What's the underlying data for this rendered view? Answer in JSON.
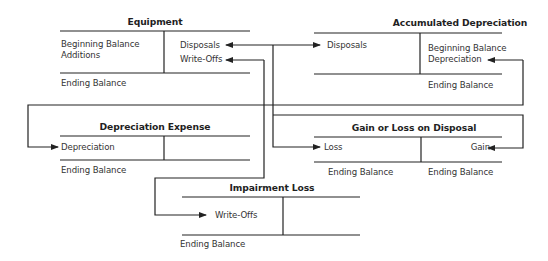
{
  "diagram": {
    "type": "t-account-flow",
    "accounts": {
      "equipment": {
        "title": "Equipment",
        "debit": [
          "Beginning Balance",
          "Additions"
        ],
        "credit": [
          "Disposals",
          "Write-Offs"
        ],
        "footer_debit": "Ending Balance"
      },
      "accumulated_depreciation": {
        "title": "Accumulated Depreciation",
        "debit": [
          "Disposals"
        ],
        "credit": [
          "Beginning Balance",
          "Depreciation"
        ],
        "footer_credit": "Ending Balance"
      },
      "depreciation_expense": {
        "title": "Depreciation Expense",
        "debit": [
          "Depreciation"
        ],
        "footer_debit": "Ending Balance"
      },
      "gain_loss_disposal": {
        "title": "Gain or Loss on Disposal",
        "debit": [
          "Loss"
        ],
        "credit": [
          "Gain"
        ],
        "footer_debit": "Ending Balance",
        "footer_credit": "Ending Balance"
      },
      "impairment_loss": {
        "title": "Impairment Loss",
        "debit": [
          "Write-Offs"
        ],
        "footer_debit": "Ending Balance"
      }
    },
    "connections": [
      {
        "from": "Equipment: Disposals",
        "to": "Accumulated Depreciation: Disposals"
      },
      {
        "from": "Equipment: Disposals",
        "to": "Gain or Loss on Disposal: Loss"
      },
      {
        "from": "Equipment: Write-Offs",
        "to": "Impairment Loss: Write-Offs"
      },
      {
        "from": "Accumulated Depreciation: Depreciation",
        "to": "Depreciation Expense: Depreciation"
      },
      {
        "from": "Gain or Loss on Disposal: Gain",
        "to": "Equipment: Disposals"
      }
    ],
    "line_color": "#222222"
  }
}
